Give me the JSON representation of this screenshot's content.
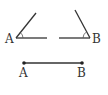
{
  "figures": {
    "angle_a": {
      "vertex_label": "A"
    },
    "angle_b": {
      "vertex_label": "B"
    },
    "segment": {
      "start_label": "A",
      "end_label": "B"
    }
  },
  "colors": {
    "stroke": "#333333",
    "background": "#ffffff"
  }
}
